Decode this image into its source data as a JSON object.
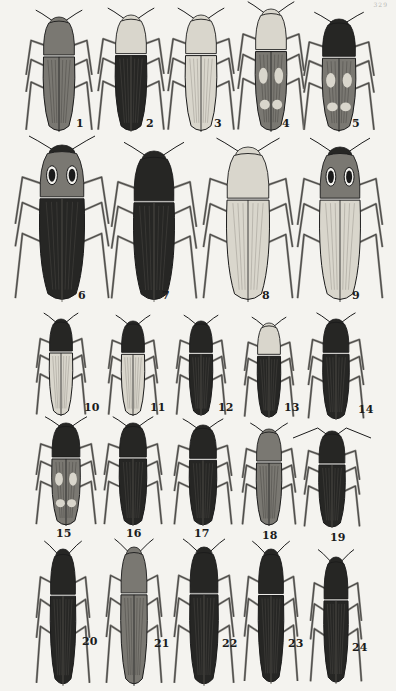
{
  "plate": {
    "page_number": "329",
    "subject": "Click beetles (Elateridae)",
    "figure_count": 24
  },
  "colors": {
    "paper": "#f4f3ef",
    "ink": "#1b1b1b",
    "light_fill": "#d9d6cc",
    "mid_fill": "#7a7872",
    "dark_fill": "#262624"
  },
  "figures": [
    {
      "id": "fig-1",
      "label": "1",
      "x": 28,
      "y": 16,
      "w": 62,
      "h": 118,
      "tone": "mid",
      "pronotum": "mid",
      "label_x": 76,
      "label_y": 118
    },
    {
      "id": "fig-2",
      "label": "2",
      "x": 100,
      "y": 14,
      "w": 62,
      "h": 120,
      "tone": "dark",
      "pronotum": "light",
      "label_x": 146,
      "label_y": 118
    },
    {
      "id": "fig-3",
      "label": "3",
      "x": 170,
      "y": 14,
      "w": 62,
      "h": 120,
      "tone": "light",
      "pronotum": "light",
      "label_x": 214,
      "label_y": 118
    },
    {
      "id": "fig-4",
      "label": "4",
      "x": 240,
      "y": 8,
      "w": 62,
      "h": 126,
      "tone": "pattern",
      "pronotum": "light",
      "label_x": 282,
      "label_y": 118
    },
    {
      "id": "fig-5",
      "label": "5",
      "x": 306,
      "y": 18,
      "w": 66,
      "h": 116,
      "tone": "pattern",
      "pronotum": "dark",
      "label_x": 352,
      "label_y": 118
    },
    {
      "id": "fig-6",
      "label": "6",
      "x": 18,
      "y": 144,
      "w": 88,
      "h": 160,
      "tone": "dark",
      "pronotum": "eyes",
      "label_x": 78,
      "label_y": 290
    },
    {
      "id": "fig-7",
      "label": "7",
      "x": 114,
      "y": 150,
      "w": 80,
      "h": 154,
      "tone": "dark",
      "pronotum": "dark",
      "label_x": 162,
      "label_y": 290
    },
    {
      "id": "fig-8",
      "label": "8",
      "x": 206,
      "y": 146,
      "w": 84,
      "h": 158,
      "tone": "light",
      "pronotum": "light",
      "label_x": 262,
      "label_y": 290
    },
    {
      "id": "fig-9",
      "label": "9",
      "x": 300,
      "y": 146,
      "w": 80,
      "h": 158,
      "tone": "light",
      "pronotum": "eyes",
      "label_x": 352,
      "label_y": 290
    },
    {
      "id": "fig-10",
      "label": "10",
      "x": 38,
      "y": 318,
      "w": 46,
      "h": 100,
      "tone": "light",
      "pronotum": "dark",
      "label_x": 84,
      "label_y": 402
    },
    {
      "id": "fig-11",
      "label": "11",
      "x": 110,
      "y": 320,
      "w": 46,
      "h": 98,
      "tone": "light",
      "pronotum": "dark",
      "label_x": 150,
      "label_y": 402
    },
    {
      "id": "fig-12",
      "label": "12",
      "x": 178,
      "y": 320,
      "w": 46,
      "h": 98,
      "tone": "dark",
      "pronotum": "dark",
      "label_x": 218,
      "label_y": 402
    },
    {
      "id": "fig-13",
      "label": "13",
      "x": 246,
      "y": 322,
      "w": 46,
      "h": 98,
      "tone": "dark",
      "pronotum": "light",
      "label_x": 284,
      "label_y": 402
    },
    {
      "id": "fig-14",
      "label": "14",
      "x": 310,
      "y": 318,
      "w": 52,
      "h": 104,
      "tone": "dark",
      "pronotum": "dark",
      "label_x": 358,
      "label_y": 404
    },
    {
      "id": "fig-15",
      "label": "15",
      "x": 38,
      "y": 422,
      "w": 56,
      "h": 106,
      "tone": "pattern",
      "pronotum": "dark",
      "label_x": 56,
      "label_y": 528
    },
    {
      "id": "fig-16",
      "label": "16",
      "x": 106,
      "y": 422,
      "w": 54,
      "h": 106,
      "tone": "dark",
      "pronotum": "dark",
      "label_x": 126,
      "label_y": 528
    },
    {
      "id": "fig-17",
      "label": "17",
      "x": 176,
      "y": 424,
      "w": 54,
      "h": 104,
      "tone": "dark",
      "pronotum": "dark",
      "label_x": 194,
      "label_y": 528
    },
    {
      "id": "fig-18",
      "label": "18",
      "x": 244,
      "y": 428,
      "w": 50,
      "h": 100,
      "tone": "mid",
      "pronotum": "mid",
      "label_x": 262,
      "label_y": 530
    },
    {
      "id": "fig-19",
      "label": "19",
      "x": 306,
      "y": 430,
      "w": 52,
      "h": 100,
      "tone": "dark",
      "pronotum": "dark",
      "label_x": 330,
      "label_y": 532
    },
    {
      "id": "fig-20",
      "label": "20",
      "x": 38,
      "y": 548,
      "w": 50,
      "h": 140,
      "tone": "dark",
      "pronotum": "dark",
      "label_x": 82,
      "label_y": 636
    },
    {
      "id": "fig-21",
      "label": "21",
      "x": 108,
      "y": 546,
      "w": 52,
      "h": 142,
      "tone": "mid",
      "pronotum": "mid",
      "label_x": 154,
      "label_y": 638
    },
    {
      "id": "fig-22",
      "label": "22",
      "x": 176,
      "y": 546,
      "w": 56,
      "h": 142,
      "tone": "dark",
      "pronotum": "dark",
      "label_x": 222,
      "label_y": 638
    },
    {
      "id": "fig-23",
      "label": "23",
      "x": 246,
      "y": 548,
      "w": 50,
      "h": 138,
      "tone": "dark",
      "pronotum": "dark",
      "label_x": 288,
      "label_y": 638
    },
    {
      "id": "fig-24",
      "label": "24",
      "x": 312,
      "y": 556,
      "w": 48,
      "h": 130,
      "tone": "dark",
      "pronotum": "dark",
      "label_x": 352,
      "label_y": 642
    }
  ]
}
